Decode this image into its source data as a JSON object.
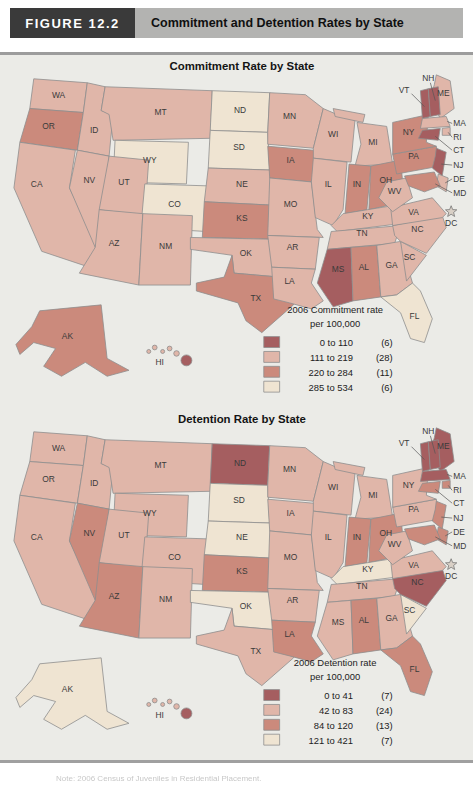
{
  "figure": {
    "label": "FIGURE 12.2",
    "title": "Commitment and Detention Rates by State"
  },
  "colors": {
    "cat1": "#a55e60",
    "cat2": "#e0b6a9",
    "cat3": "#cb8a7c",
    "cat4": "#efe4d2",
    "panel_bg": "#ebebe7",
    "header_box": "#3a3a3a",
    "header_bar": "#b3b3b1",
    "state_border": "#8d8d8d"
  },
  "maps": [
    {
      "id": "commitment",
      "title": "Commitment Rate by State",
      "legend": {
        "title_line1": "2006 Commitment rate",
        "title_line2": "per 100,000",
        "items": [
          {
            "range": "0 to 110",
            "count": "(6)",
            "cat": 1
          },
          {
            "range": "111 to 219",
            "count": "(28)",
            "cat": 2
          },
          {
            "range": "220 to 284",
            "count": "(11)",
            "cat": 3
          },
          {
            "range": "285 to 534",
            "count": "(6)",
            "cat": 4
          }
        ]
      },
      "dc": {
        "label": "DC",
        "cat": 4
      },
      "states": {
        "WA": 2,
        "OR": 3,
        "CA": 2,
        "NV": 2,
        "ID": 2,
        "UT": 2,
        "AZ": 2,
        "NM": 2,
        "MT": 2,
        "WY": 4,
        "CO": 4,
        "ND": 4,
        "SD": 4,
        "NE": 2,
        "KS": 3,
        "OK": 2,
        "TX": 3,
        "MN": 2,
        "IA": 3,
        "MO": 2,
        "AR": 2,
        "LA": 2,
        "WI": 2,
        "IL": 2,
        "MI": 2,
        "IN": 3,
        "OH": 3,
        "KY": 2,
        "TN": 2,
        "MS": 1,
        "AL": 3,
        "GA": 2,
        "FL": 4,
        "SC": 2,
        "NC": 2,
        "VA": 2,
        "WV": 2,
        "PA": 3,
        "NY": 3,
        "ME": 2,
        "VT": 1,
        "NH": 1,
        "MA": 2,
        "RI": 2,
        "CT": 1,
        "NJ": 1,
        "DE": 2,
        "MD": 3,
        "AK": 3,
        "HI": 1
      }
    },
    {
      "id": "detention",
      "title": "Detention Rate by State",
      "legend": {
        "title_line1": "2006 Detention rate",
        "title_line2": "per 100,000",
        "items": [
          {
            "range": "0 to 41",
            "count": "(7)",
            "cat": 1
          },
          {
            "range": "42 to 83",
            "count": "(24)",
            "cat": 2
          },
          {
            "range": "84 to 120",
            "count": "(13)",
            "cat": 3
          },
          {
            "range": "121 to 421",
            "count": "(7)",
            "cat": 4
          }
        ]
      },
      "dc": {
        "label": "DC",
        "cat": 4
      },
      "states": {
        "WA": 2,
        "OR": 2,
        "CA": 2,
        "NV": 3,
        "ID": 2,
        "UT": 2,
        "AZ": 3,
        "NM": 2,
        "MT": 2,
        "WY": 2,
        "CO": 2,
        "ND": 1,
        "SD": 4,
        "NE": 4,
        "KS": 3,
        "OK": 4,
        "TX": 2,
        "MN": 2,
        "IA": 2,
        "MO": 2,
        "AR": 2,
        "LA": 3,
        "WI": 2,
        "IL": 2,
        "MI": 2,
        "IN": 3,
        "OH": 3,
        "KY": 4,
        "TN": 2,
        "MS": 2,
        "AL": 3,
        "GA": 2,
        "FL": 3,
        "SC": 4,
        "NC": 1,
        "VA": 2,
        "WV": 2,
        "PA": 2,
        "NY": 2,
        "ME": 1,
        "VT": 1,
        "NH": 1,
        "MA": 1,
        "RI": 3,
        "CT": 3,
        "NJ": 3,
        "DE": 3,
        "MD": 3,
        "AK": 4,
        "HI": 1
      }
    }
  ],
  "footnote": "Note: 2006 Census of Juveniles in Residential Placement."
}
